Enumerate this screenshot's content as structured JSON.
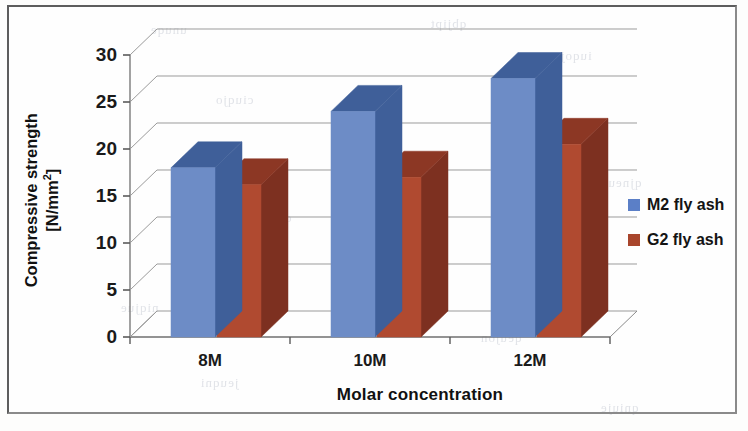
{
  "chart_data": {
    "type": "bar",
    "title": "",
    "subtitle": "",
    "xlabel": "Molar concentration",
    "ylabel": "Compressive strength [N/mm²]",
    "ylabel_line1": "Compressive strength",
    "ylabel_line2_prefix": "[N/mm",
    "ylabel_line2_sup": "2",
    "ylabel_line2_suffix": "]",
    "categories": [
      "8M",
      "10M",
      "12M"
    ],
    "yticks": [
      0,
      5,
      10,
      15,
      20,
      25,
      30
    ],
    "ytick_labels": [
      "0",
      "5",
      "10",
      "15",
      "20",
      "25",
      "30"
    ],
    "ylim": [
      0,
      30
    ],
    "grid": true,
    "legend_position": "right",
    "three_d": true,
    "series": [
      {
        "name": "M2 fly ash",
        "color": "#6d8cc6",
        "top_color": "#3f5f99",
        "side_color": "#3f5f99",
        "values": [
          18.0,
          24.0,
          27.5
        ]
      },
      {
        "name": "G2 fly ash",
        "color": "#b04a30",
        "top_color": "#8c3724",
        "side_color": "#7d3020",
        "values": [
          16.2,
          17.0,
          20.5
        ]
      }
    ]
  },
  "legend": {
    "items": [
      {
        "label": "M2 fly ash",
        "color": "#5b7fc7"
      },
      {
        "label": "G2 fly ash",
        "color": "#a8452c"
      }
    ]
  },
  "background_bleed": [
    {
      "text": "qbjipt",
      "x": 430,
      "y": 16
    },
    {
      "text": "unuqe",
      "x": 150,
      "y": 22
    },
    {
      "text": "iuqoj",
      "x": 560,
      "y": 48
    },
    {
      "text": "ciuqjo",
      "x": 215,
      "y": 92
    },
    {
      "text": "opjueq",
      "x": 520,
      "y": 120
    },
    {
      "text": "uqjien",
      "x": 180,
      "y": 150
    },
    {
      "text": "qjneuq",
      "x": 600,
      "y": 175
    },
    {
      "text": "opuqje",
      "x": 250,
      "y": 210
    },
    {
      "text": "uejqon",
      "x": 545,
      "y": 255
    },
    {
      "text": "niqjue",
      "x": 120,
      "y": 300
    },
    {
      "text": "qeujon",
      "x": 480,
      "y": 330
    },
    {
      "text": "jeuqni",
      "x": 200,
      "y": 375
    },
    {
      "text": "qniuje",
      "x": 600,
      "y": 400
    }
  ]
}
